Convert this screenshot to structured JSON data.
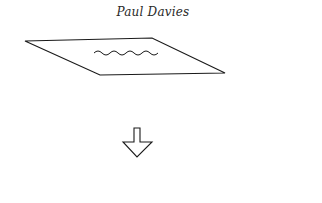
{
  "header": {
    "author": "Paul Davies"
  },
  "figure": {
    "plane": {
      "shape": "parallelogram",
      "points": "25,41 152,38 225,73 100,75",
      "stroke": "#1a1a1a"
    },
    "wave": {
      "shape": "wavy-line",
      "x_start": 94,
      "x_end": 158,
      "y_center": 53,
      "humps": 8
    },
    "arrow": {
      "shape": "down-arrow-outline",
      "points": "134,128 140,128 140,142 152,142 137,157 123,142 134,142",
      "stroke": "#1a1a1a"
    }
  }
}
